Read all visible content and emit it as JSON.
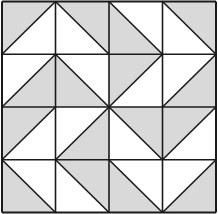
{
  "grid": {
    "rows": 4,
    "cols": 4
  },
  "colors": {
    "shaded": "#d9d9d9",
    "light": "#ffffff",
    "line": "#1a1a1a"
  },
  "cells": [
    [
      {
        "diag": "/",
        "shaded": "tl"
      },
      {
        "diag": "\\",
        "shaded": "tr"
      },
      {
        "diag": "\\",
        "shaded": "bl"
      },
      {
        "diag": "\\",
        "shaded": "tr"
      }
    ],
    [
      {
        "diag": "/",
        "shaded": "br"
      },
      {
        "diag": "\\",
        "shaded": "bl"
      },
      {
        "diag": "/",
        "shaded": "tl"
      },
      {
        "diag": "/",
        "shaded": "br"
      }
    ],
    [
      {
        "diag": "/",
        "shaded": "tl"
      },
      {
        "diag": "/",
        "shaded": "br"
      },
      {
        "diag": "\\",
        "shaded": "tr"
      },
      {
        "diag": "/",
        "shaded": "tl"
      }
    ],
    [
      {
        "diag": "\\",
        "shaded": "bl"
      },
      {
        "diag": "\\",
        "shaded": "tr"
      },
      {
        "diag": "\\",
        "shaded": "bl"
      },
      {
        "diag": "/",
        "shaded": "br"
      }
    ]
  ]
}
